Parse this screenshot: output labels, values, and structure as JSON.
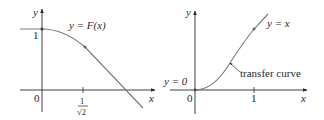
{
  "left_graph": {
    "y_axis_label": "y",
    "x_axis_label": "x",
    "origin_label": "0",
    "y_tick_label": "1",
    "x_tick_numerator": "1",
    "x_tick_denominator": "√2",
    "curve_label": "y = F(x)"
  },
  "right_graph": {
    "y_axis_label": "y",
    "x_axis_label": "x",
    "origin_label": "0",
    "x_tick_label": "1",
    "asymptote_low_label": "y = 0",
    "asymptote_high_label": "y = x",
    "curve_annotation": "transfer curve"
  },
  "colors": {
    "axis": "#2a2a2a",
    "curve": "#7a7a7a",
    "point": "#555555"
  }
}
